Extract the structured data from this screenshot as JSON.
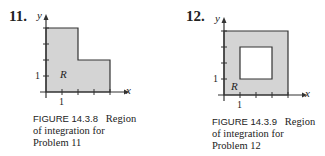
{
  "problems": [
    {
      "number": "11.",
      "figure_label": "FIGURE 14.3.8",
      "caption_lines": [
        "Region",
        "of integration for",
        "Problem 11"
      ],
      "axis_x": "x",
      "axis_y": "y",
      "region_label": "R",
      "tick_x": "1",
      "tick_y": "1",
      "region_shape": "L-shaped: [0,2]x[0,4] union [2,4]x[0,2]"
    },
    {
      "number": "12.",
      "figure_label": "FIGURE 14.3.9",
      "caption_lines": [
        "Region",
        "of integration for",
        "Problem 12"
      ],
      "axis_x": "x",
      "axis_y": "y",
      "region_label": "R",
      "tick_x": "1",
      "tick_y": "1",
      "region_shape": "Square [0,4]x[0,4] minus hole [1,3]x[1,3]"
    }
  ],
  "colors": {
    "fill": "#d4d4d4",
    "line": "#333333"
  }
}
